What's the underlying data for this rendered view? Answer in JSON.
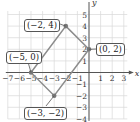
{
  "chart_data": {
    "type": "scatter",
    "title": "",
    "xlabel": "x",
    "ylabel": "y",
    "xlim": [
      -7,
      3
    ],
    "ylim": [
      -4,
      5
    ],
    "grid": true,
    "x_ticks": [
      "-7",
      "-6",
      "-5",
      "-4",
      "-3",
      "-2",
      "-1",
      "1",
      "2",
      "3"
    ],
    "y_ticks": [
      "-4",
      "-3",
      "-2",
      "-1",
      "1",
      "2",
      "3",
      "4",
      "5"
    ],
    "polygon": "parallelogram",
    "points": [
      {
        "x": -2,
        "y": 4,
        "label": "(−2, 4)"
      },
      {
        "x": 0,
        "y": 2,
        "label": "(0, 2)"
      },
      {
        "x": -3,
        "y": -2,
        "label": "(−3, −2)"
      },
      {
        "x": -5,
        "y": 0,
        "label": "(−5, 0)"
      }
    ],
    "colors": {
      "line": "#8c8c8c",
      "grid": "#d9d9d9",
      "axis": "#555555",
      "point": "#777777"
    }
  },
  "labels": {
    "p1": "(−2, 4)",
    "p2": "(0, 2)",
    "p3": "(−3, −2)",
    "p4": "(−5, 0)",
    "xaxis": "x",
    "yaxis": "y"
  }
}
